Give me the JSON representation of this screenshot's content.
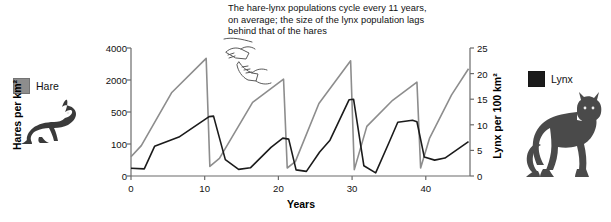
{
  "annotation": {
    "text": "The hare-lynx populations cycle every 11 years,\non average; the size of the lynx population lags\nbehind that of the hares",
    "pointer_icon": "pointing-hand-icon"
  },
  "legend": {
    "hare": {
      "label": "Hare",
      "color": "#8d8d8d",
      "image": "hare-illustration"
    },
    "lynx": {
      "label": "Lynx",
      "color": "#1b1b1b",
      "image": "lynx-illustration"
    }
  },
  "chart_data": {
    "type": "line",
    "title": "",
    "xlabel": "Years",
    "ylabel": "Hares per km²",
    "y2label": "Lynx per 100 km²",
    "grid": false,
    "legend_position": "outside-left-and-right",
    "xlim": [
      0,
      46
    ],
    "xticks": [
      0,
      10,
      20,
      30,
      40
    ],
    "xtick_labels": [
      "0",
      "10",
      "20",
      "30",
      "40"
    ],
    "y_left_ticks": [
      0,
      100,
      500,
      2000,
      4000
    ],
    "y_left_tick_labels": [
      "0",
      "100",
      "500",
      "2000",
      "4000"
    ],
    "y_left_scale": "non-linear",
    "y_right_ticks": [
      0,
      5,
      10,
      15,
      20,
      25
    ],
    "y_right_tick_labels": [
      "0",
      "5",
      "10",
      "15",
      "20",
      "25"
    ],
    "y_right_lim": [
      0,
      25
    ],
    "series": [
      {
        "name": "Hare",
        "axis": "left",
        "color": "#8d8d8d",
        "units": "hares per km²",
        "points": [
          {
            "x": 0,
            "y": 60
          },
          {
            "x": 1.4,
            "y": 95
          },
          {
            "x": 5.5,
            "y": 1400
          },
          {
            "x": 10.2,
            "y": 3350
          },
          {
            "x": 10.7,
            "y": 30
          },
          {
            "x": 12.0,
            "y": 55
          },
          {
            "x": 16.5,
            "y": 950
          },
          {
            "x": 20.7,
            "y": 2050
          },
          {
            "x": 21.2,
            "y": 25
          },
          {
            "x": 22.3,
            "y": 45
          },
          {
            "x": 25.5,
            "y": 900
          },
          {
            "x": 29.8,
            "y": 3200
          },
          {
            "x": 30.3,
            "y": 20
          },
          {
            "x": 32.0,
            "y": 320
          },
          {
            "x": 35.5,
            "y": 1050
          },
          {
            "x": 38.8,
            "y": 1900
          },
          {
            "x": 39.3,
            "y": 25
          },
          {
            "x": 40.5,
            "y": 170
          },
          {
            "x": 43.5,
            "y": 1300
          },
          {
            "x": 45.8,
            "y": 2700
          }
        ]
      },
      {
        "name": "Lynx",
        "axis": "right",
        "color": "#1b1b1b",
        "units": "lynx per 100 km²",
        "points": [
          {
            "x": 0,
            "y": 1.5
          },
          {
            "x": 1.8,
            "y": 1.4
          },
          {
            "x": 3.2,
            "y": 5.8
          },
          {
            "x": 6.5,
            "y": 7.6
          },
          {
            "x": 10.6,
            "y": 11.6
          },
          {
            "x": 11.2,
            "y": 11.7
          },
          {
            "x": 12.8,
            "y": 3.2
          },
          {
            "x": 14.6,
            "y": 1.3
          },
          {
            "x": 16.2,
            "y": 1.6
          },
          {
            "x": 19.0,
            "y": 5.6
          },
          {
            "x": 20.6,
            "y": 7.4
          },
          {
            "x": 21.4,
            "y": 7.2
          },
          {
            "x": 22.4,
            "y": 1.2
          },
          {
            "x": 23.8,
            "y": 0.9
          },
          {
            "x": 25.6,
            "y": 4.7
          },
          {
            "x": 27.0,
            "y": 7.0
          },
          {
            "x": 29.6,
            "y": 14.9
          },
          {
            "x": 30.2,
            "y": 15.0
          },
          {
            "x": 31.6,
            "y": 2.0
          },
          {
            "x": 33.2,
            "y": 0.6
          },
          {
            "x": 35.0,
            "y": 6.5
          },
          {
            "x": 36.2,
            "y": 10.5
          },
          {
            "x": 38.2,
            "y": 10.9
          },
          {
            "x": 38.8,
            "y": 10.6
          },
          {
            "x": 39.8,
            "y": 3.7
          },
          {
            "x": 41.2,
            "y": 3.1
          },
          {
            "x": 42.6,
            "y": 3.5
          },
          {
            "x": 45.8,
            "y": 6.7
          }
        ]
      }
    ]
  }
}
